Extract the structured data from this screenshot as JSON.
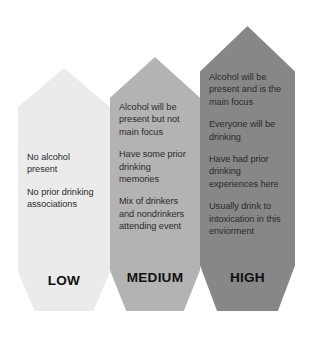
{
  "diagram": {
    "type": "risk-level-arrow-chart",
    "levels": [
      {
        "id": "low",
        "label": "LOW",
        "color": "#ebebeb",
        "lines": [
          "No alcohol present",
          "No prior drinking associations"
        ]
      },
      {
        "id": "medium",
        "label": "MEDIUM",
        "color": "#b3b3b3",
        "lines": [
          "Alcohol will be present but not main focus",
          "Have some prior drinking memories",
          "Mix of drinkers and nondrinkers attending event"
        ]
      },
      {
        "id": "high",
        "label": "HIGH",
        "color": "#878787",
        "lines": [
          "Alcohol will be present and is the main focus",
          "Everyone will be drinking",
          "Have had prior drinking experiences here",
          "Usually drink to intoxication in this enviorment"
        ]
      }
    ]
  }
}
